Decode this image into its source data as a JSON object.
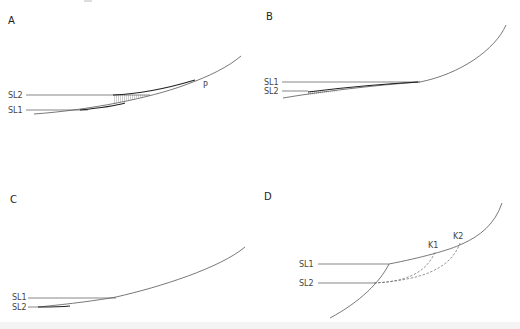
{
  "figure": {
    "panels": [
      {
        "id": "A",
        "letter": "A",
        "labels": {
          "upper_line": "SL2",
          "lower_line": "SL1",
          "point": "P"
        },
        "features": [
          "shoreline curve",
          "sea level SL2 above SL1",
          "hatched wedge between SL2 line and slope"
        ]
      },
      {
        "id": "B",
        "letter": "B",
        "labels": {
          "upper_line": "SL1",
          "lower_line": "SL2"
        },
        "features": [
          "steep concave-up slope",
          "sea level SL1 above SL2",
          "hatched wedge near SL2"
        ]
      },
      {
        "id": "C",
        "letter": "C",
        "labels": {
          "upper_line": "SL1",
          "lower_line": "SL2"
        },
        "features": [
          "gentle slope",
          "SL1 above SL2"
        ]
      },
      {
        "id": "D",
        "letter": "D",
        "labels": {
          "upper_line": "SL1",
          "lower_line": "SL2",
          "point1": "K1",
          "point2": "K2"
        },
        "features": [
          "slope with offshore scarp",
          "dashed profiles from SL2 to K1 and K2"
        ]
      }
    ]
  }
}
